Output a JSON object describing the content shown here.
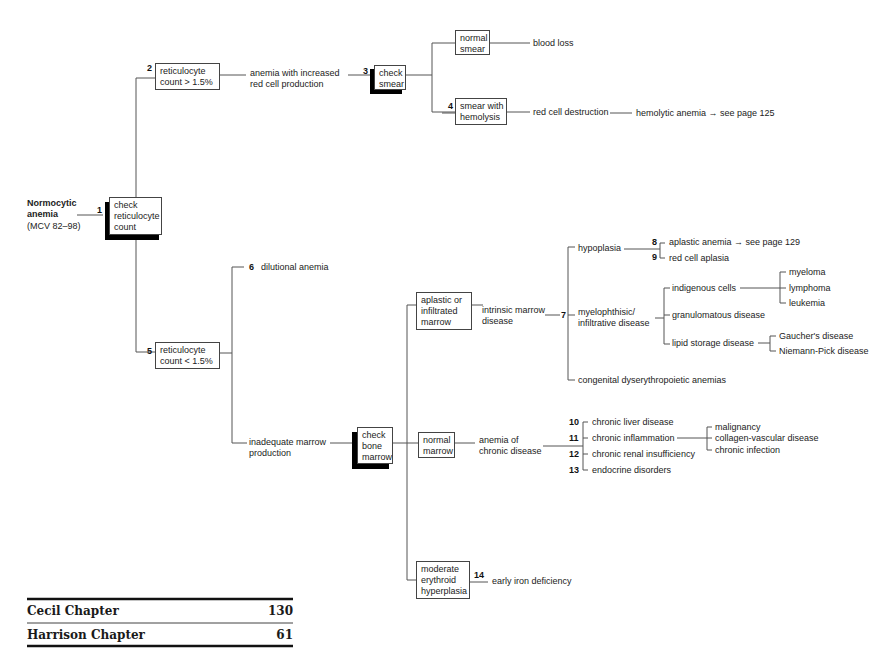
{
  "root": {
    "title_line1": "Normocytic",
    "title_line2": "anemia",
    "subtitle": "(MCV 82–98)"
  },
  "nodes": {
    "n1": {
      "num": "1",
      "lines": [
        "check",
        "reticulocyte",
        "count"
      ]
    },
    "n2": {
      "num": "2",
      "lines": [
        "reticulocyte",
        "count > 1.5%"
      ]
    },
    "n2_result": [
      "anemia with increased",
      "red cell production"
    ],
    "n3": {
      "num": "3",
      "lines": [
        "check",
        "smear"
      ]
    },
    "normal_smear": [
      "normal",
      "smear"
    ],
    "blood_loss": "blood loss",
    "n4": {
      "num": "4",
      "lines": [
        "smear with",
        "hemolysis"
      ]
    },
    "red_cell_destruction": "red cell destruction",
    "hemolytic_anemia": "hemolytic anemia → see page 125",
    "n5": {
      "num": "5",
      "lines": [
        "reticulocyte",
        "count < 1.5%"
      ]
    },
    "n6": {
      "num": "6",
      "label": "dilutional anemia"
    },
    "inadequate": [
      "inadequate marrow",
      "production"
    ],
    "check_marrow": [
      "check",
      "bone",
      "marrow"
    ],
    "aplastic": [
      "aplastic or",
      "infiltrated",
      "marrow"
    ],
    "intrinsic": [
      "intrinsic marrow",
      "disease"
    ],
    "n7": {
      "num": "7"
    },
    "hypoplasia": "hypoplasia",
    "n8": {
      "num": "8",
      "label": "aplastic anemia → see page 129"
    },
    "n9": {
      "num": "9",
      "label": "red cell aplasia"
    },
    "myelophthisic": [
      "myelophthisic/",
      "infiltrative disease"
    ],
    "indigenous": "indigenous cells",
    "myeloma": "myeloma",
    "lymphoma": "lymphoma",
    "leukemia": "leukemia",
    "granulomatous": "granulomatous disease",
    "lipid": "lipid storage disease",
    "gaucher": "Gaucher's disease",
    "niemann": "Niemann-Pick disease",
    "congenital": "congenital dyserythropoietic anemias",
    "normal_marrow": [
      "normal",
      "marrow"
    ],
    "chronic_disease": [
      "anemia of",
      "chronic disease"
    ],
    "n10": {
      "num": "10",
      "label": "chronic liver disease"
    },
    "n11": {
      "num": "11",
      "label": "chronic inflammation"
    },
    "n12": {
      "num": "12",
      "label": "chronic renal insufficiency"
    },
    "n13": {
      "num": "13",
      "label": "endocrine disorders"
    },
    "malignancy": "malignancy",
    "collagen": "collagen-vascular disease",
    "infection": "chronic infection",
    "moderate": [
      "moderate",
      "erythroid",
      "hyperplasia"
    ],
    "n14": {
      "num": "14",
      "label": "early iron deficiency"
    }
  },
  "references": [
    {
      "label": "Cecil Chapter",
      "value": "130"
    },
    {
      "label": "Harrison Chapter",
      "value": "61"
    }
  ],
  "colors": {
    "line": "#555555",
    "shadow": "#000000",
    "text": "#222222"
  }
}
